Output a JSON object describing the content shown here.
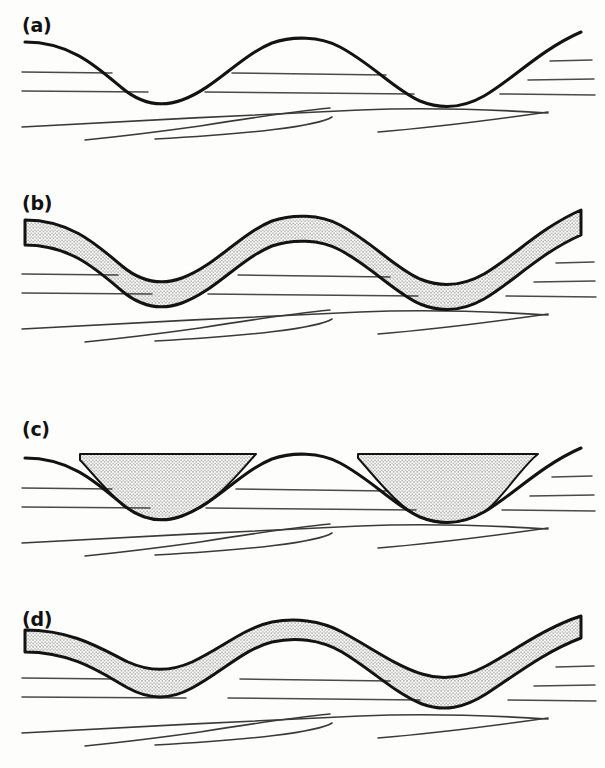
{
  "figure": {
    "type": "geological-cross-section-diagram",
    "background_color": "#fdfdfc",
    "line_color": "#131313",
    "strata_color": "#4a4a4a",
    "stipple_color": "#2a2a2a",
    "width": 605,
    "height": 768,
    "panel_count": 4
  },
  "panels": [
    {
      "id": "a",
      "label": "(a)",
      "label_x": 22,
      "label_y": 14,
      "origin_y": 0,
      "fill": "none",
      "description": "Undulating folded surface with truncated horizontal strata beneath, no sediment fill"
    },
    {
      "id": "b",
      "label": "(b)",
      "label_x": 22,
      "label_y": 192,
      "origin_y": 178,
      "fill": "stipple-uniform-band",
      "description": "Uniform thickness stippled bed draped conformably over the undulating surface"
    },
    {
      "id": "c",
      "label": "(c)",
      "label_x": 22,
      "label_y": 418,
      "origin_y": 398,
      "fill": "stipple-trough-fill-flat-top",
      "description": "Stippled sediment ponded in troughs only, with flat horizontal tops onlapping the flanks"
    },
    {
      "id": "d",
      "label": "(d)",
      "label_x": 22,
      "label_y": 608,
      "origin_y": 590,
      "fill": "stipple-variable-band",
      "description": "Stippled bed thickening in the troughs and thinning over the crests"
    }
  ],
  "geometry": {
    "wave_path": "M 25 42 C 70 42 96 66 122 88 C 140 103 160 108 182 100 C 215 88 240 56 272 43 C 292 36 320 36 340 47 C 372 64 395 90 420 101 C 442 110 463 108 484 96 C 512 80 540 50 581 32",
    "crest_x": 307,
    "crest_y": 38,
    "trough1_x": 148,
    "trough1_y": 103,
    "trough2_x": 466,
    "trough2_y": 106,
    "left_edge_y": 42,
    "right_edge_y": 32,
    "band_thickness_uniform": 25,
    "flat_fill_level_c": 56,
    "band_thickness_d_crest": 20,
    "band_thickness_d_trough": 52
  },
  "strata": {
    "upper_left": [
      {
        "name": "upper-left-line-1",
        "d": "M 22 72 L 112 73"
      },
      {
        "name": "upper-left-line-2",
        "d": "M 22 91 L 148 92"
      }
    ],
    "upper_middle": [
      {
        "name": "upper-middle-line-1",
        "d": "M 232 73 L 386 75"
      },
      {
        "name": "upper-middle-line-2",
        "d": "M 205 92 L 414 94"
      }
    ],
    "upper_right": [
      {
        "name": "upper-right-line-1",
        "d": "M 550 61 L 590 60"
      },
      {
        "name": "upper-right-line-2",
        "d": "M 528 80 L 592 79"
      },
      {
        "name": "upper-right-line-3",
        "d": "M 500 94 L 593 95"
      }
    ],
    "lower_continuous": [
      {
        "name": "lower-long-line",
        "d": "M 22 127 C 120 122 260 114 360 110 C 430 107 500 110 548 113"
      },
      {
        "name": "lower-lens-line-top",
        "d": "M 330 108 C 290 112 250 118 200 126 C 150 134 110 139 85 141"
      }
    ],
    "lower_discontinuous": [
      {
        "name": "lower-short-line-1",
        "d": "M 155 138 C 250 133 320 125 330 117"
      },
      {
        "name": "lower-short-line-2",
        "d": "M 375 131 C 440 126 490 119 545 112"
      }
    ]
  },
  "stipple": {
    "dot_radius": 0.55,
    "spacing": 3.4,
    "color": "#2b2b2b",
    "pattern": "regular-jittered-dots"
  }
}
